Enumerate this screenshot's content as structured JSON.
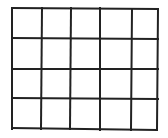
{
  "diagram": {
    "type": "grid",
    "rows": 4,
    "columns": 5,
    "line_color": "#222222",
    "background": "#ffffff",
    "v_lines": [
      [
        12,
        8,
        12,
        129
      ],
      [
        42,
        8,
        41,
        129
      ],
      [
        71,
        8,
        70,
        129
      ],
      [
        100,
        8,
        100,
        130
      ],
      [
        132,
        9,
        131,
        130
      ],
      [
        158,
        9,
        157,
        130
      ]
    ],
    "h_lines": [
      [
        12,
        8,
        158,
        9
      ],
      [
        12,
        38,
        158,
        39
      ],
      [
        12,
        69,
        158,
        69
      ],
      [
        12,
        98,
        158,
        99
      ],
      [
        12,
        128,
        157,
        130
      ]
    ]
  }
}
